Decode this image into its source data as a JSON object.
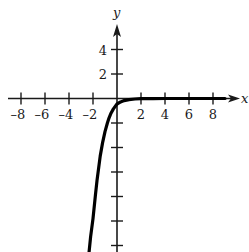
{
  "chart_data": {
    "type": "line",
    "title": "",
    "xlabel": "x",
    "ylabel": "y",
    "xlim": [
      -8.8,
      10
    ],
    "ylim": [
      -12.6,
      6
    ],
    "grid": false,
    "legend": null,
    "x_ticks": [
      -8,
      -6,
      -4,
      -2,
      2,
      4,
      6,
      8
    ],
    "x_tick_labels": [
      "-8",
      "-6",
      "-4",
      "-2",
      "2",
      "4",
      "6",
      "8"
    ],
    "y_ticks": [
      4,
      2,
      -2,
      -4,
      -6,
      -8,
      -10,
      -12
    ],
    "y_tick_labels": [
      "4",
      "2",
      "",
      "",
      "",
      "",
      "",
      ""
    ],
    "series": [
      {
        "name": "curve",
        "x": [
          -2.33,
          -2.2,
          -2.0,
          -1.8,
          -1.67,
          -1.4,
          -1.2,
          -1.0,
          -0.8,
          -0.67,
          -0.5,
          -0.3,
          0.0,
          0.3,
          0.6,
          1.0,
          1.5,
          2.0,
          3.0,
          4.0,
          6.0,
          8.0,
          9.0
        ],
        "y": [
          -12.6,
          -11.3,
          -9.8,
          -7.9,
          -6.7,
          -4.7,
          -3.6,
          -2.7,
          -2.0,
          -1.6,
          -1.2,
          -0.85,
          -0.45,
          -0.28,
          -0.17,
          -0.09,
          -0.04,
          -0.02,
          -0.005,
          0,
          0,
          0,
          0
        ]
      }
    ],
    "colors": {
      "curve": "#000000",
      "axes": "#1a1a1a"
    }
  }
}
